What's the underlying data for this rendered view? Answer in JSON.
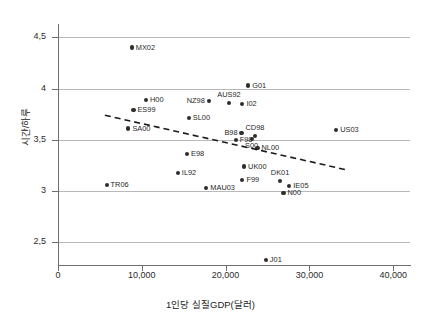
{
  "chart_data": {
    "type": "scatter",
    "title": "",
    "xlabel": "1인당 실질GDP(달러)",
    "ylabel": "시간/하루",
    "xlim": [
      0,
      42000
    ],
    "ylim": [
      2.28,
      4.62
    ],
    "grid": true,
    "legend": null,
    "x_ticks": [
      0,
      10000,
      20000,
      30000,
      40000
    ],
    "x_ticklabels": [
      "0",
      "10,000",
      "20,000",
      "30,000",
      "40,000"
    ],
    "y_ticks": [
      2.5,
      3,
      3.5,
      4,
      4.5
    ],
    "y_ticklabels": [
      "2,5",
      "3",
      "3,5",
      "4",
      "4,5"
    ],
    "marker_color": "#2d2d2d",
    "gridline_color": "#b9b9b9",
    "points": [
      {
        "label": "MX02",
        "x": 8800,
        "y": 4.4,
        "pos": "right"
      },
      {
        "label": "G01",
        "x": 22700,
        "y": 4.03,
        "pos": "right"
      },
      {
        "label": "H00",
        "x": 10500,
        "y": 3.89,
        "pos": "right"
      },
      {
        "label": "NZ98",
        "x": 18000,
        "y": 3.88,
        "pos": "left"
      },
      {
        "label": "AUS92",
        "x": 20400,
        "y": 3.86,
        "pos": "above"
      },
      {
        "label": "I02",
        "x": 22000,
        "y": 3.85,
        "pos": "right"
      },
      {
        "label": "ES99",
        "x": 9000,
        "y": 3.79,
        "pos": "right"
      },
      {
        "label": "SL00",
        "x": 15600,
        "y": 3.71,
        "pos": "right"
      },
      {
        "label": "SA00",
        "x": 8400,
        "y": 3.61,
        "pos": "right"
      },
      {
        "label": "US03",
        "x": 33200,
        "y": 3.6,
        "pos": "right"
      },
      {
        "label": "B98",
        "x": 21900,
        "y": 3.57,
        "pos": "left"
      },
      {
        "label": "CD98",
        "x": 23500,
        "y": 3.54,
        "pos": "above"
      },
      {
        "label": "F98",
        "x": 21200,
        "y": 3.5,
        "pos": "right"
      },
      {
        "label": "S00",
        "x": 23100,
        "y": 3.51,
        "pos": "below"
      },
      {
        "label": "NL00",
        "x": 23800,
        "y": 3.42,
        "pos": "right"
      },
      {
        "label": "E98",
        "x": 15400,
        "y": 3.36,
        "pos": "right"
      },
      {
        "label": "UK00",
        "x": 22200,
        "y": 3.24,
        "pos": "right"
      },
      {
        "label": "IL92",
        "x": 14300,
        "y": 3.18,
        "pos": "right"
      },
      {
        "label": "F99",
        "x": 22000,
        "y": 3.11,
        "pos": "right"
      },
      {
        "label": "DK01",
        "x": 26500,
        "y": 3.1,
        "pos": "above"
      },
      {
        "label": "TR06",
        "x": 5800,
        "y": 3.06,
        "pos": "right"
      },
      {
        "label": "IE05",
        "x": 27600,
        "y": 3.05,
        "pos": "right"
      },
      {
        "label": "MAU03",
        "x": 17700,
        "y": 3.03,
        "pos": "right"
      },
      {
        "label": "N00",
        "x": 26900,
        "y": 2.98,
        "pos": "right"
      },
      {
        "label": "J01",
        "x": 24800,
        "y": 2.33,
        "pos": "right"
      }
    ],
    "trendline": {
      "style": "dashed",
      "color": "#1a1a1a",
      "x_start": 5600,
      "y_start": 3.74,
      "x_end": 34300,
      "y_end": 3.21
    }
  }
}
